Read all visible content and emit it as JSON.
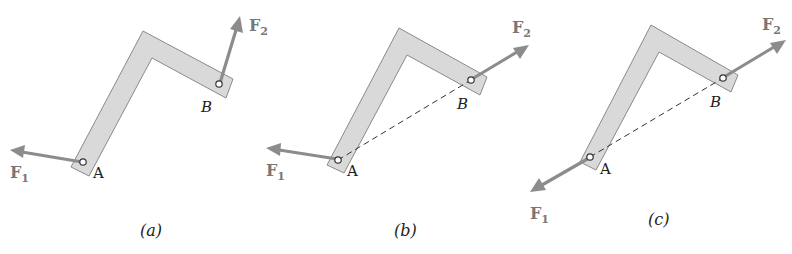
{
  "figure": {
    "panels": [
      {
        "id": "a",
        "caption": "(a)",
        "point_a": "A",
        "point_b": "B",
        "force_1": {
          "label": "F",
          "sub": "1",
          "direction": "left-slightly-up, applied at A"
        },
        "force_2": {
          "label": "F",
          "sub": "2",
          "direction": "up-right steep, applied at B"
        },
        "line_of_action": false
      },
      {
        "id": "b",
        "caption": "(b)",
        "point_a": "A",
        "point_b": "B",
        "force_1": {
          "label": "F",
          "sub": "1",
          "direction": "left-slightly-up, applied at A"
        },
        "force_2": {
          "label": "F",
          "sub": "2",
          "direction": "along AB, away from A"
        },
        "line_of_action": true
      },
      {
        "id": "c",
        "caption": "(c)",
        "point_a": "A",
        "point_b": "B",
        "force_1": {
          "label": "F",
          "sub": "1",
          "direction": "along BA, away from B"
        },
        "force_2": {
          "label": "F",
          "sub": "2",
          "direction": "along AB, away from A"
        },
        "line_of_action": true
      }
    ],
    "colors": {
      "bar_fill": "#d9d9d9",
      "bar_stroke": "#8a8a8a",
      "arrow": "#8c8c8c",
      "force_label": "#777777",
      "text": "#222222"
    }
  }
}
